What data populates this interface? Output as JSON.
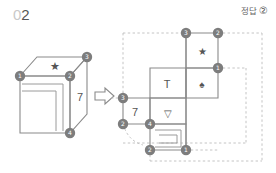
{
  "page": {
    "question_number_prefix": "0",
    "question_number": "2",
    "answer_label": "정답",
    "answer_choice": "②"
  },
  "colors": {
    "line": "#8a8a8a",
    "line_dark": "#6f6f6f",
    "marker_fill": "#7d7d7d",
    "marker_text": "#ffffff",
    "dashed": "#b9b9b9",
    "text": "#555555",
    "pale_text": "#c9c9c9",
    "background": "#ffffff"
  },
  "cube": {
    "caption": "isometric cube with marked vertices",
    "face_right_label": "7",
    "face_top_symbol": "★",
    "face_front_symbol": "nested-squares",
    "vertex_markers": [
      {
        "id": "1",
        "label": "①",
        "x": 20,
        "y": 76
      },
      {
        "id": "2",
        "label": "②",
        "x": 70,
        "y": 76
      },
      {
        "id": "3",
        "label": "③",
        "x": 87,
        "y": 57
      },
      {
        "id": "4",
        "label": "④",
        "x": 70,
        "y": 133
      }
    ]
  },
  "arrow": {
    "name": "transform-arrow",
    "direction": "right",
    "glyph": "⇒"
  },
  "net": {
    "caption": "unfolded cube net with symbols",
    "cells": [
      {
        "name": "star-cell",
        "symbol": "★",
        "type": "glyph"
      },
      {
        "name": "spade-cell",
        "symbol": "♠",
        "type": "glyph"
      },
      {
        "name": "tee-cell",
        "symbol": "T",
        "type": "text"
      },
      {
        "name": "seven-cell",
        "symbol": "7",
        "type": "text"
      },
      {
        "name": "triangle-cell",
        "symbol": "▽",
        "type": "glyph"
      },
      {
        "name": "nested-squares-cell",
        "symbol": "nested-squares",
        "type": "shape"
      }
    ],
    "vertex_markers": [
      {
        "id": "3",
        "label": "③",
        "x": 186,
        "y": 33
      },
      {
        "id": "2",
        "label": "②",
        "x": 218,
        "y": 33
      },
      {
        "id": "1",
        "label": "①",
        "x": 218,
        "y": 68
      },
      {
        "id": "3b",
        "label": "③",
        "x": 123,
        "y": 98
      },
      {
        "id": "2b",
        "label": "②",
        "x": 123,
        "y": 124
      },
      {
        "id": "4",
        "label": "④",
        "x": 150,
        "y": 124
      },
      {
        "id": "2c",
        "label": "②",
        "x": 150,
        "y": 150
      },
      {
        "id": "1b",
        "label": "①",
        "x": 186,
        "y": 150
      }
    ]
  }
}
